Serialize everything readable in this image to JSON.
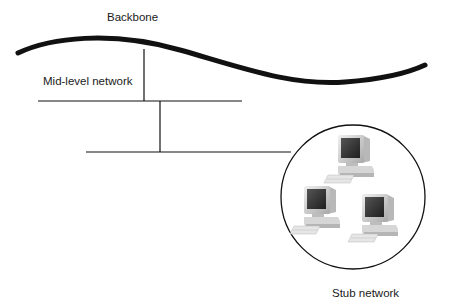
{
  "labels": {
    "backbone": "Backbone",
    "mid_level": "Mid-level network",
    "stub": "Stub network"
  },
  "colors": {
    "line": "#111111",
    "monitor_body": "#d4d4d4",
    "screen": "#2e2e2e"
  },
  "stub_network": {
    "computer_count": 3
  }
}
